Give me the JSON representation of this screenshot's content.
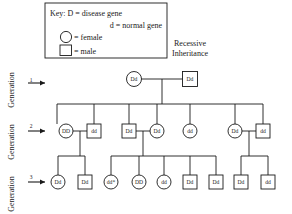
{
  "title": {
    "line1": "Recessive",
    "line2": "Inheritance"
  },
  "key": {
    "label": "Key:",
    "rows": [
      {
        "symbol_text": "D",
        "equals": "=",
        "meaning": "disease gene"
      },
      {
        "symbol_text": "d",
        "equals": "=",
        "meaning": "normal gene"
      },
      {
        "symbol_text": "circle-icon",
        "equals": "=",
        "meaning": "female"
      },
      {
        "symbol_text": "square-icon",
        "equals": "=",
        "meaning": "male"
      }
    ],
    "line1": "Key:  D = disease gene",
    "line2": "d  = normal gene",
    "line3": "= female",
    "line4": "= male"
  },
  "generations": [
    {
      "label": "Generation",
      "number": "1"
    },
    {
      "label": "Generation",
      "number": "2"
    },
    {
      "label": "Generation",
      "number": "3"
    }
  ],
  "pedigree": {
    "generation1": [
      {
        "id": "g1-f",
        "sex": "female",
        "genotype": "Dd",
        "cx": 134,
        "cy": 79
      },
      {
        "id": "g1-m",
        "sex": "male",
        "genotype": "Dd",
        "cx": 190,
        "cy": 79
      }
    ],
    "generation2": [
      {
        "id": "g2-a",
        "sex": "female",
        "genotype": "DD",
        "cx": 66,
        "cy": 131
      },
      {
        "id": "g2-b",
        "sex": "male",
        "genotype": "dd",
        "cx": 94,
        "cy": 131
      },
      {
        "id": "g2-c",
        "sex": "male",
        "genotype": "Dd",
        "cx": 129,
        "cy": 131
      },
      {
        "id": "g2-d",
        "sex": "female",
        "genotype": "Dd",
        "cx": 157,
        "cy": 131
      },
      {
        "id": "g2-e",
        "sex": "female",
        "genotype": "dd",
        "cx": 190,
        "cy": 131
      },
      {
        "id": "g2-f",
        "sex": "female",
        "genotype": "Dd",
        "cx": 235,
        "cy": 131
      },
      {
        "id": "g2-g",
        "sex": "male",
        "genotype": "dd",
        "cx": 263,
        "cy": 131
      }
    ],
    "generation3": [
      {
        "id": "g3-a",
        "sex": "female",
        "genotype": "Dd",
        "cx": 58,
        "cy": 182
      },
      {
        "id": "g3-b",
        "sex": "male",
        "genotype": "Dd",
        "cx": 85,
        "cy": 182
      },
      {
        "id": "g3-c",
        "sex": "female",
        "genotype": "dd*",
        "cx": 111,
        "cy": 182
      },
      {
        "id": "g3-d",
        "sex": "female",
        "genotype": "DD",
        "cx": 139,
        "cy": 182
      },
      {
        "id": "g3-e",
        "sex": "female",
        "genotype": "dd",
        "cx": 164,
        "cy": 182
      },
      {
        "id": "g3-f",
        "sex": "male",
        "genotype": "Dd",
        "cx": 190,
        "cy": 182
      },
      {
        "id": "g3-g",
        "sex": "male",
        "genotype": "Dd",
        "cx": 216,
        "cy": 182
      },
      {
        "id": "g3-h",
        "sex": "male",
        "genotype": "Dd",
        "cx": 241,
        "cy": 182
      },
      {
        "id": "g3-i",
        "sex": "male",
        "genotype": "dd",
        "cx": 268,
        "cy": 182
      }
    ]
  },
  "colors": {
    "stroke": "#1a1a1a",
    "background": "#ffffff"
  }
}
